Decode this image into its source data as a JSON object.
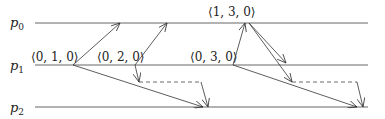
{
  "diagram": {
    "type": "vector-clock-message-diagram",
    "processes": [
      {
        "id": "p0",
        "name": "p",
        "sub": "0",
        "y": 23
      },
      {
        "id": "p1",
        "name": "p",
        "sub": "1",
        "y": 65
      },
      {
        "id": "p2",
        "name": "p",
        "sub": "2",
        "y": 107
      }
    ],
    "timestamps": [
      {
        "process": "p1",
        "label": "⟨0, 1, 0⟩",
        "x": 31,
        "y": 60
      },
      {
        "process": "p1",
        "label": "⟨0, 2, 0⟩",
        "x": 97,
        "y": 60
      },
      {
        "process": "p1",
        "label": "⟨0, 3, 0⟩",
        "x": 190,
        "y": 60
      },
      {
        "process": "p0",
        "label": "⟨1, 3, 0⟩",
        "x": 208,
        "y": 15
      }
    ],
    "messages": [
      {
        "from": [
          73,
          65
        ],
        "to": [
          120,
          23
        ],
        "style": "solid"
      },
      {
        "from": [
          73,
          65
        ],
        "to": [
          203,
          107
        ],
        "style": "solid"
      },
      {
        "from": [
          135,
          65
        ],
        "to": [
          167,
          23
        ],
        "style": "solid"
      },
      {
        "from": [
          135,
          65
        ],
        "to": [
          139,
          82
        ],
        "style": "solid"
      },
      {
        "from": [
          233,
          65
        ],
        "to": [
          245,
          23
        ],
        "style": "solid"
      },
      {
        "from": [
          233,
          65
        ],
        "to": [
          357,
          107
        ],
        "style": "solid"
      },
      {
        "from": [
          249,
          23
        ],
        "to": [
          286,
          63
        ],
        "style": "solid"
      },
      {
        "from": [
          249,
          23
        ],
        "to": [
          292,
          82
        ],
        "style": "solid"
      }
    ],
    "delayed_deliveries": [
      {
        "points": [
          [
            139,
            82
          ],
          [
            201,
            82
          ],
          [
            208,
            107
          ]
        ],
        "style": "dashed"
      },
      {
        "points": [
          [
            292,
            82
          ],
          [
            357,
            82
          ],
          [
            363,
            107
          ]
        ],
        "style": "dashed"
      }
    ]
  }
}
